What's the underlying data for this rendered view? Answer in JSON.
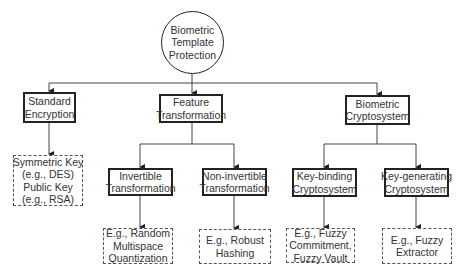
{
  "diagram": {
    "root": {
      "lines": [
        "Biometric",
        "Template",
        "Protection"
      ]
    },
    "level1": [
      {
        "id": "standard",
        "lines": [
          "Standard",
          "Encryption"
        ]
      },
      {
        "id": "feature",
        "lines": [
          "Feature",
          "Transformation"
        ]
      },
      {
        "id": "crypto",
        "lines": [
          "Biometric",
          "Cryptosystem"
        ]
      }
    ],
    "level2": [
      {
        "id": "invertible",
        "parent": "feature",
        "lines": [
          "Invertible",
          "Transformation"
        ]
      },
      {
        "id": "noninvertible",
        "parent": "feature",
        "lines": [
          "Non-invertible",
          "Transformation"
        ]
      },
      {
        "id": "keybinding",
        "parent": "crypto",
        "lines": [
          "Key-binding",
          "Cryptosystem"
        ]
      },
      {
        "id": "keygenerating",
        "parent": "crypto",
        "lines": [
          "Key-generating",
          "Cryptosystem"
        ]
      }
    ],
    "examples": [
      {
        "id": "ex-standard",
        "parent": "standard",
        "lines": [
          "Symmetric Key",
          "(e.g., DES)",
          "Public Key",
          "(e.g., RSA)"
        ]
      },
      {
        "id": "ex-invertible",
        "parent": "invertible",
        "lines": [
          "E.g., Random",
          "Multispace",
          "Quantization"
        ]
      },
      {
        "id": "ex-noninvertible",
        "parent": "noninvertible",
        "lines": [
          "E.g., Robust",
          "Hashing"
        ]
      },
      {
        "id": "ex-keybinding",
        "parent": "keybinding",
        "lines": [
          "E.g., Fuzzy",
          "Commitment,",
          "Fuzzy Vault"
        ]
      },
      {
        "id": "ex-keygenerating",
        "parent": "keygenerating",
        "lines": [
          "E.g., Fuzzy",
          "Extractor"
        ]
      }
    ]
  }
}
